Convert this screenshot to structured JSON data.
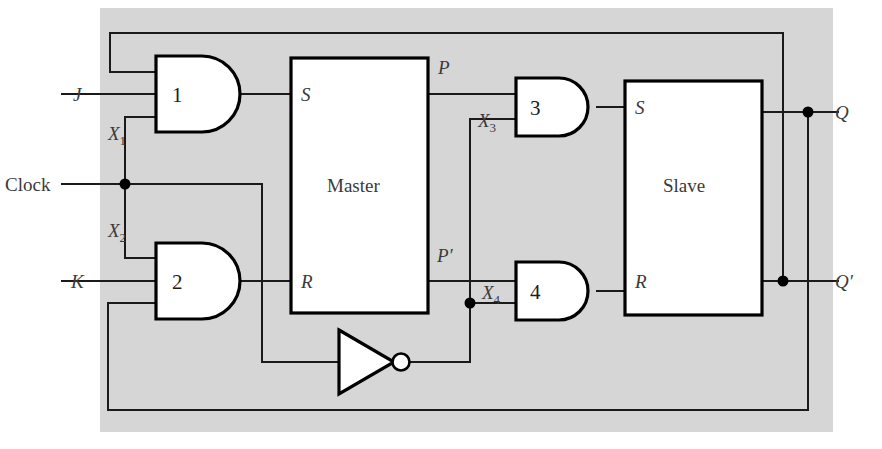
{
  "figure": {
    "kind": "logic-circuit-diagram",
    "background_color": "#ffffff",
    "panel_color": "#d6d6d6",
    "wire_color": "#1a1a1a"
  },
  "inputs": {
    "j": "J",
    "k": "K",
    "clock": "Clock"
  },
  "outputs": {
    "q": "Q",
    "q_not": "Q′"
  },
  "gates": [
    {
      "id": "gate1",
      "label": "1",
      "type": "and"
    },
    {
      "id": "gate2",
      "label": "2",
      "type": "and"
    },
    {
      "id": "gate3",
      "label": "3",
      "type": "and"
    },
    {
      "id": "gate4",
      "label": "4",
      "type": "and"
    }
  ],
  "inverter": {
    "id": "inverter",
    "type": "not",
    "label": ""
  },
  "blocks": [
    {
      "id": "master",
      "label": "Master",
      "input_s": "S",
      "input_r": "R",
      "output_top": "P",
      "output_bottom": "P′"
    },
    {
      "id": "slave",
      "label": "Slave",
      "input_s": "S",
      "input_r": "R"
    }
  ],
  "signal_labels": {
    "x1": {
      "base": "X",
      "sub": "1"
    },
    "x2": {
      "base": "X",
      "sub": "2"
    },
    "x3": {
      "base": "X",
      "sub": "3"
    },
    "x4": {
      "base": "X",
      "sub": "4"
    },
    "p": "P",
    "p_not": "P′"
  },
  "block_ports": {
    "master_s": "S",
    "master_r": "R",
    "slave_s": "S",
    "slave_r": "R"
  }
}
